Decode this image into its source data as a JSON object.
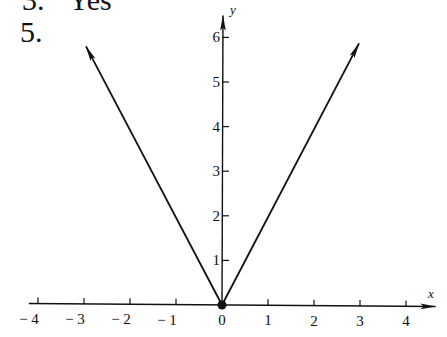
{
  "problem": {
    "previous_number": "3.",
    "previous_answer": "Yes",
    "number": "5."
  },
  "chart_data": {
    "type": "line",
    "title": "",
    "xlabel": "x",
    "ylabel": "y",
    "x_ticks": [
      -4,
      -3,
      -2,
      -1,
      0,
      1,
      2,
      3,
      4
    ],
    "x_tick_labels": [
      "− 4",
      "− 3",
      "− 2",
      "− 1",
      "0",
      "1",
      "2",
      "3",
      "4"
    ],
    "y_ticks": [
      1,
      2,
      3,
      4,
      5,
      6
    ],
    "y_tick_labels": [
      "1",
      "2",
      "3",
      "4",
      "5",
      "6"
    ],
    "xlim": [
      -4.5,
      4.6
    ],
    "ylim": [
      0,
      6.4
    ],
    "grid": false,
    "series": [
      {
        "name": "left branch",
        "x": [
          0,
          -3
        ],
        "y": [
          0,
          6
        ],
        "arrow_end": true
      },
      {
        "name": "right branch",
        "x": [
          0,
          3
        ],
        "y": [
          0,
          6
        ],
        "arrow_end": true
      }
    ],
    "points": [
      {
        "x": 0,
        "y": 0,
        "marker": "filled-dot"
      }
    ]
  }
}
